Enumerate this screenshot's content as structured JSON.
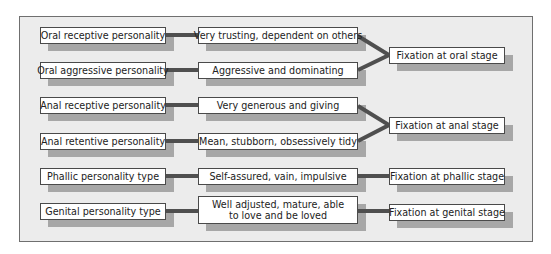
{
  "diagram": {
    "rows": [
      {
        "personality": "Oral receptive personality",
        "traits": "Very trusting, dependent on others"
      },
      {
        "personality": "Oral aggressive personality",
        "traits": "Aggressive and dominating"
      },
      {
        "personality": "Anal receptive personality",
        "traits": "Very generous and giving"
      },
      {
        "personality": "Anal retentive personality",
        "traits": "Mean, stubborn, obsessively tidy"
      },
      {
        "personality": "Phallic personality type",
        "traits": "Self-assured, vain, impulsive"
      },
      {
        "personality": "Genital personality type",
        "traits_line1": "Well adjusted, mature, able",
        "traits_line2": "to love and be loved"
      }
    ],
    "fixations": [
      "Fixation at oral stage",
      "Fixation at anal stage",
      "Fixation at phallic stage",
      "Fixation at genital stage"
    ],
    "colors": {
      "panel_bg": "#ececec",
      "box_bg": "#ffffff",
      "shadow": "#a7a7a7",
      "connector": "#4f4f4f"
    }
  }
}
